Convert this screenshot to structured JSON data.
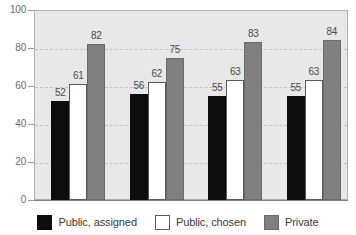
{
  "chart_data": {
    "type": "bar",
    "title": "",
    "subtitle": "",
    "xlabel": "",
    "ylabel": "",
    "ylim": [
      0,
      100
    ],
    "yticks": [
      0,
      20,
      40,
      60,
      80,
      100
    ],
    "ytick_labels": [
      "0",
      "20",
      "40",
      "60",
      "80",
      "100"
    ],
    "grid": true,
    "grid_style": "dashed-horizontal",
    "legend_position": "bottom-center",
    "categories": [
      "1",
      "2",
      "3",
      "4"
    ],
    "category_labels_visible": false,
    "series": [
      {
        "name": "Public, assigned",
        "color": "#0d0d0d",
        "values": [
          52,
          56,
          55,
          55
        ]
      },
      {
        "name": "Public, chosen",
        "color": "#ffffff",
        "values": [
          61,
          62,
          63,
          63
        ]
      },
      {
        "name": "Private",
        "color": "#808080",
        "values": [
          82,
          75,
          83,
          84
        ]
      }
    ],
    "data_labels": [
      [
        "52",
        "61",
        "82"
      ],
      [
        "56",
        "62",
        "75"
      ],
      [
        "55",
        "63",
        "83"
      ],
      [
        "55",
        "63",
        "84"
      ]
    ]
  },
  "legend": {
    "items": [
      {
        "label": "Public, assigned"
      },
      {
        "label": "Public, chosen"
      },
      {
        "label": "Private"
      }
    ]
  }
}
